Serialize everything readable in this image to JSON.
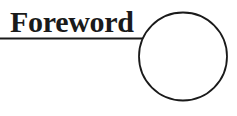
{
  "heading": {
    "title": "Foreword"
  },
  "decoration": {
    "underline_color": "#1a1a1a",
    "circle_color": "#1a1a1a"
  }
}
